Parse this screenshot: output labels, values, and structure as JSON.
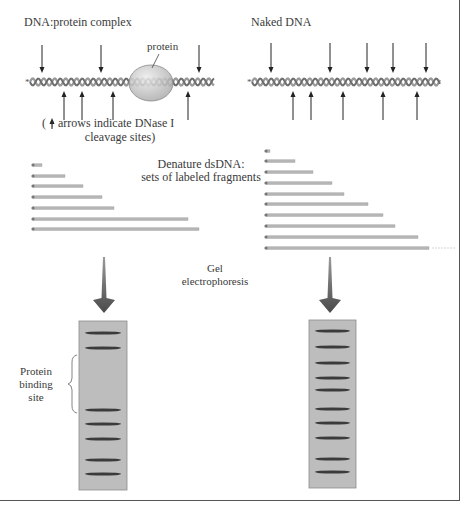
{
  "left_panel": {
    "title": "DNA:protein complex",
    "protein_label": "protein",
    "legend_line1": "( ↑ arrows indicate DNase I",
    "legend_line2": "cleavage sites)",
    "helix": {
      "x1": 30,
      "x2": 214,
      "y": 82
    },
    "protein": {
      "cx": 151,
      "cy": 83,
      "rx": 22,
      "ry": 18
    },
    "down_arrows_x": [
      42,
      101,
      199
    ],
    "up_arrows_x": [
      64,
      82,
      113,
      188
    ],
    "fragments": {
      "x_start": 33,
      "ends": [
        42,
        65,
        83,
        102,
        114,
        188,
        199
      ],
      "y": [
        165,
        176,
        186,
        197,
        208,
        219,
        229
      ]
    },
    "gel": {
      "x": 79,
      "y": 321,
      "w": 48,
      "h": 169,
      "bands_y": [
        333,
        348,
        410,
        424,
        439,
        460,
        474
      ]
    },
    "big_arrow_x": 104,
    "binding_site_label": [
      "Protein",
      "binding",
      "site"
    ]
  },
  "right_panel": {
    "title": "Naked DNA",
    "helix": {
      "x1": 252,
      "x2": 440,
      "y": 82
    },
    "down_arrows_x": [
      271,
      330,
      367,
      393,
      426
    ],
    "up_arrows_x": [
      293,
      311,
      343,
      383,
      417
    ],
    "fragments": {
      "x_start": 266,
      "ends": [
        270,
        295,
        313,
        332,
        344,
        368,
        383,
        395,
        418,
        429
      ],
      "y": [
        151,
        161,
        172,
        183,
        194,
        204,
        215,
        226,
        237,
        248
      ]
    },
    "gel": {
      "x": 309,
      "y": 320,
      "w": 47,
      "h": 168,
      "bands_y": [
        331,
        347,
        363,
        378,
        390,
        409,
        423,
        438,
        459,
        472
      ]
    },
    "big_arrow_x": 330
  },
  "center_labels": {
    "denature_line1": "Denature dsDNA:",
    "denature_line2": "sets of labeled fragments",
    "gel_line1": "Gel",
    "gel_line2": "electrophoresis"
  },
  "colors": {
    "strand": "#9a9a9a",
    "strand_dark": "#6e6e6e",
    "arrow": "#222222",
    "protein_fill": "#c9c9c9",
    "protein_stroke": "#8a8a8a",
    "fragment": "#b5b5b5",
    "gel_fill": "#bdbdbd",
    "gel_stroke": "#8c8c8c",
    "band": "#3b3b3b",
    "big_arrow": "#5a5a5a"
  },
  "label_marker": "*"
}
